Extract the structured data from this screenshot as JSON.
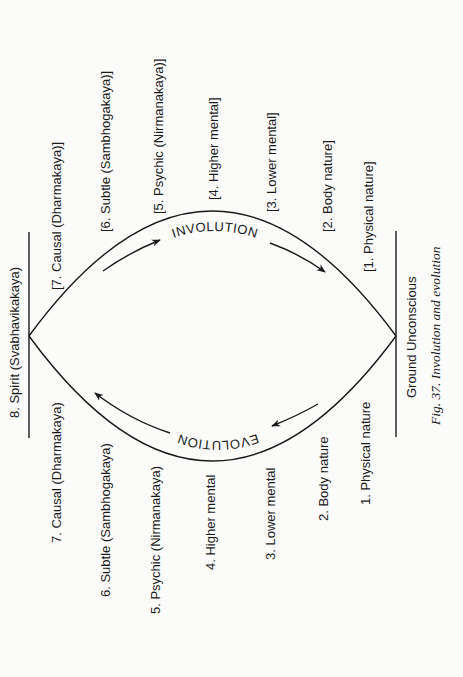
{
  "figure": {
    "caption": "Fig. 37. Involution and evolution",
    "top_node": "8. Spirit (Svabhavikakaya)",
    "bottom_node": "Ground Unconscious",
    "involution_label": "INVOLUTION",
    "evolution_label": "EVOLUTION",
    "involution_levels": [
      "[7. Causal (Dharmakaya)]",
      "[6. Subtle (Sambhogakaya)]",
      "[5. Psychic (Nirmanakaya)]",
      "[4. Higher mental]",
      "[3. Lower mental]",
      "[2. Body nature]",
      "[1. Physical nature]"
    ],
    "evolution_levels": [
      "7. Causal (Dharmakaya)",
      "6. Subtle (Sambhogakaya)",
      "5. Psychic (Nirmanakaya)",
      "4. Higher mental",
      "3. Lower mental",
      "2. Body nature",
      "1. Physical nature"
    ]
  },
  "colors": {
    "ink": "#1a1a1a",
    "paper": "#fbfbfa"
  }
}
